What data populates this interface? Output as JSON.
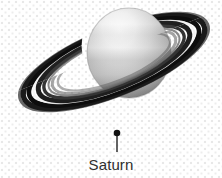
{
  "figure": {
    "kind": "astronomy-illustration",
    "subject": "Saturn",
    "style": "grayscale halftone diagram",
    "background_color": "#ffffff",
    "background_pattern_color": "#e8e8e8",
    "width": 222,
    "height": 178
  },
  "planet": {
    "name": "Saturn",
    "body_highlight_color": "#f2f2f2",
    "body_midtone_color": "#b9b9b9",
    "body_shadow_color": "#7d7d7d",
    "center_x": 129,
    "center_y": 53,
    "radius_x": 42,
    "radius_y": 45
  },
  "rings": {
    "outer_color": "#4a4a4a",
    "mid_color": "#1c1c1c",
    "inner_color": "#2a2a2a",
    "gap_color": "#f4f4f4",
    "tilt_degrees": -22,
    "band_count": 6
  },
  "callout": {
    "leader_dot_color": "#111111",
    "leader_line_color": "#222222",
    "leader_x": 117,
    "leader_top_y": 131,
    "leader_bottom_y": 152,
    "label": "Saturn",
    "label_color": "#2e2e2e"
  }
}
